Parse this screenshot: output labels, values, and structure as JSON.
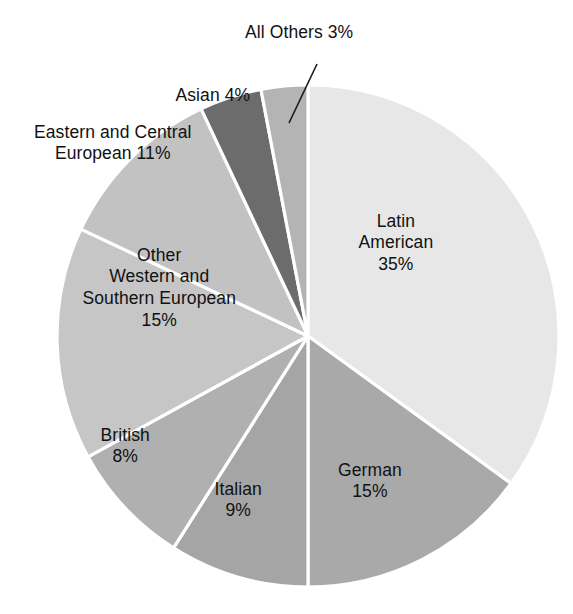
{
  "chart_data": {
    "type": "pie",
    "title": "",
    "subtitle": "",
    "xlabel": "",
    "ylabel": "",
    "legend_position": "none",
    "grid": false,
    "units": "percent",
    "start_angle_deg": 0,
    "direction": "clockwise",
    "total": 100,
    "categories": [
      "Latin American",
      "German",
      "Italian",
      "British",
      "Other Western and Southern European",
      "Eastern and Central European",
      "Asian",
      "All Others"
    ],
    "values": [
      35,
      15,
      9,
      8,
      15,
      11,
      4,
      3
    ],
    "slices": [
      {
        "name": "Latin American",
        "value": 35,
        "value_text": "35%",
        "color": "#e7e7e7",
        "label_lines": [
          "Latin",
          "American",
          "35%"
        ],
        "label_placement": "inside",
        "label_x": 396,
        "label_y": 243,
        "callout": false
      },
      {
        "name": "German",
        "value": 15,
        "value_text": "15%",
        "color": "#a9a9a9",
        "label_lines": [
          "German",
          "15%"
        ],
        "label_placement": "inside",
        "label_x": 370,
        "label_y": 481,
        "callout": false
      },
      {
        "name": "Italian",
        "value": 9,
        "value_text": "9%",
        "color": "#a5a5a5",
        "label_lines": [
          "Italian",
          "9%"
        ],
        "label_placement": "inside",
        "label_x": 238,
        "label_y": 500,
        "callout": false
      },
      {
        "name": "British",
        "value": 8,
        "value_text": "8%",
        "color": "#b0b0b0",
        "label_lines": [
          "British",
          "8%"
        ],
        "label_placement": "inside",
        "label_x": 125,
        "label_y": 446,
        "callout": false
      },
      {
        "name": "Other Western and Southern European",
        "value": 15,
        "value_text": "15%",
        "color": "#c6c6c6",
        "label_lines": [
          "Other",
          "Western and",
          "Southern European",
          "15%"
        ],
        "label_placement": "inside",
        "label_x": 159,
        "label_y": 288,
        "callout": false
      },
      {
        "name": "Eastern and Central European",
        "value": 11,
        "value_text": "11%",
        "color": "#c2c2c2",
        "label_lines": [
          "Eastern and Central",
          "European 11%"
        ],
        "label_placement": "outside",
        "label_x": 113,
        "label_y": 143,
        "callout": false
      },
      {
        "name": "Asian",
        "value": 4,
        "value_text": "4%",
        "color": "#6c6c6c",
        "label_lines": [
          "Asian 4%"
        ],
        "label_placement": "outside",
        "label_x": 213,
        "label_y": 96,
        "callout": false
      },
      {
        "name": "All Others",
        "value": 3,
        "value_text": "3%",
        "color": "#b4b4b4",
        "label_lines": [
          "All Others 3%"
        ],
        "label_placement": "outside",
        "label_x": 299,
        "label_y": 33,
        "callout": true,
        "callout_from_x": 317,
        "callout_from_y": 64,
        "callout_to_x": 289,
        "callout_to_y": 123
      }
    ],
    "geometry": {
      "center_x": 308,
      "center_y": 336,
      "radius": 251,
      "separator_color": "#ffffff",
      "separator_width": 3.2
    }
  }
}
